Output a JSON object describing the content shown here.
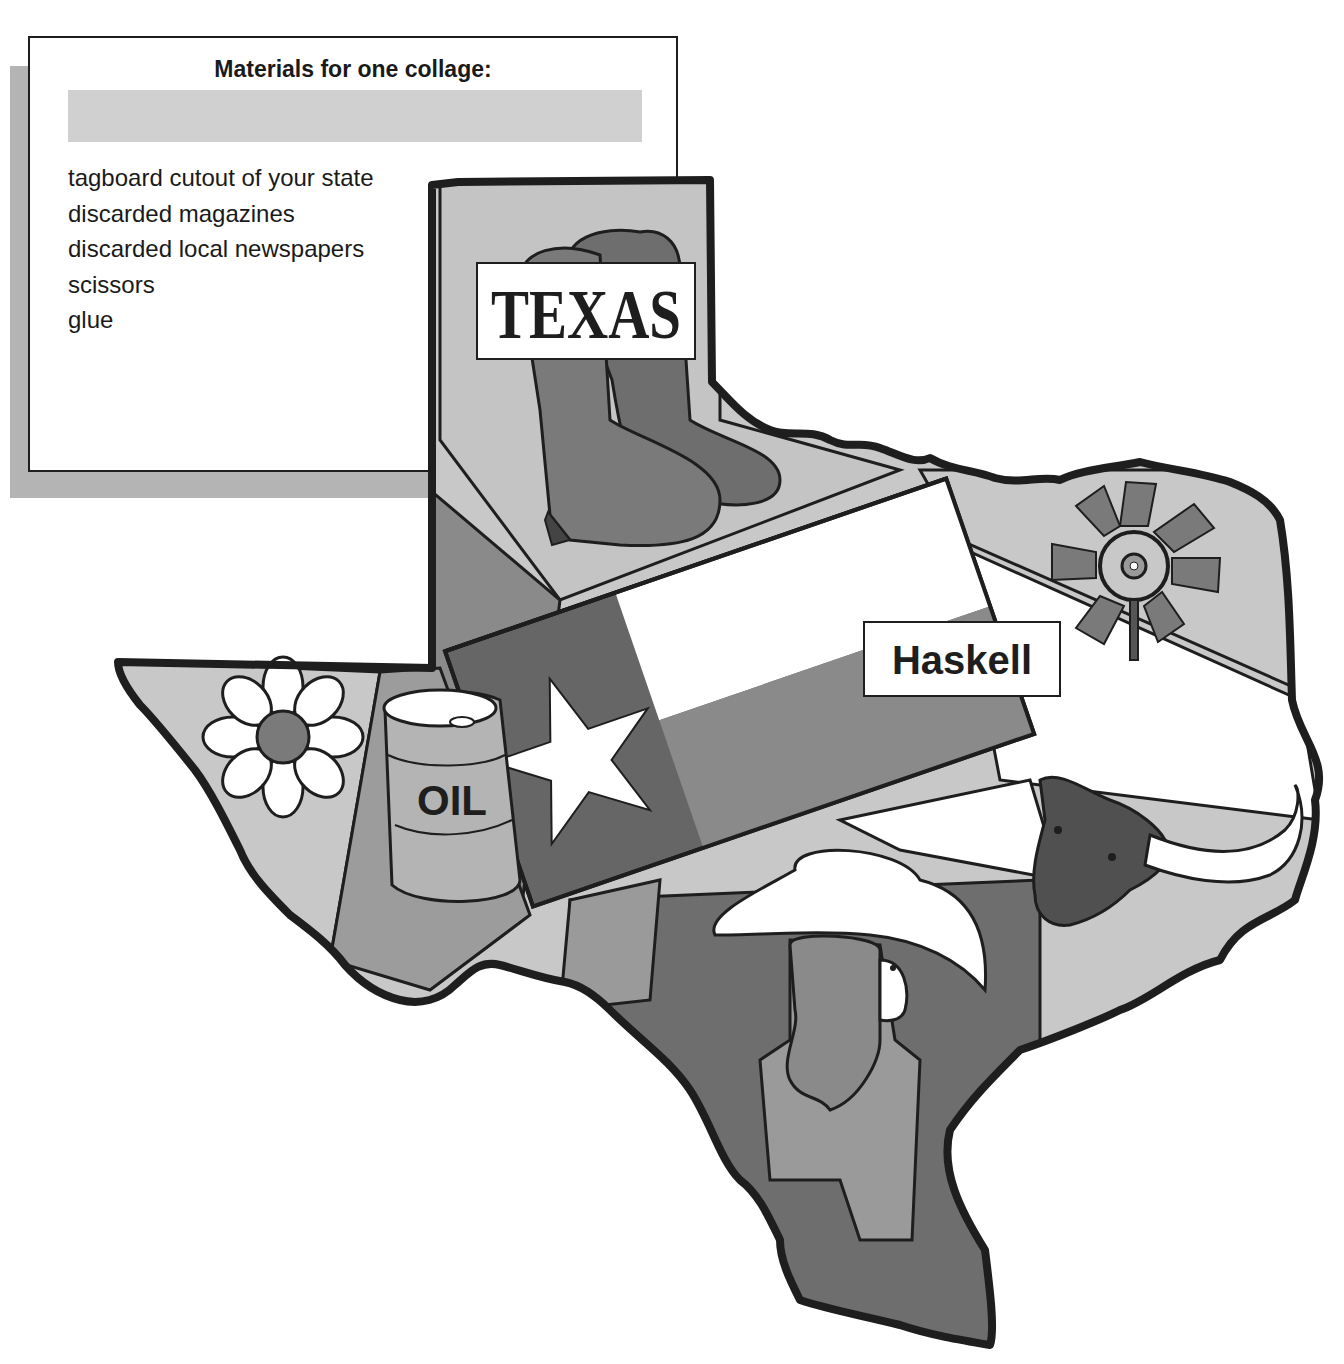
{
  "materials": {
    "title": "Materials for one collage:",
    "items": [
      "tagboard cutout of your state",
      "discarded magazines",
      "discarded local newspapers",
      "scissors",
      "glue"
    ]
  },
  "collage": {
    "state_sign": "TEXAS",
    "town_sign": "Haskell",
    "barrel_label": "OIL",
    "icons": [
      "cowboy-boots",
      "texas-flag",
      "windmill",
      "longhorn-steer",
      "daisy-flower",
      "oil-barrel",
      "cowgirl-with-hat"
    ]
  },
  "colors": {
    "outline": "#1e1e1e",
    "light_gray": "#c8c8c8",
    "mid_gray": "#9a9a9a",
    "dark_gray": "#6e6e6e",
    "darker_gray": "#585858",
    "white": "#ffffff"
  }
}
